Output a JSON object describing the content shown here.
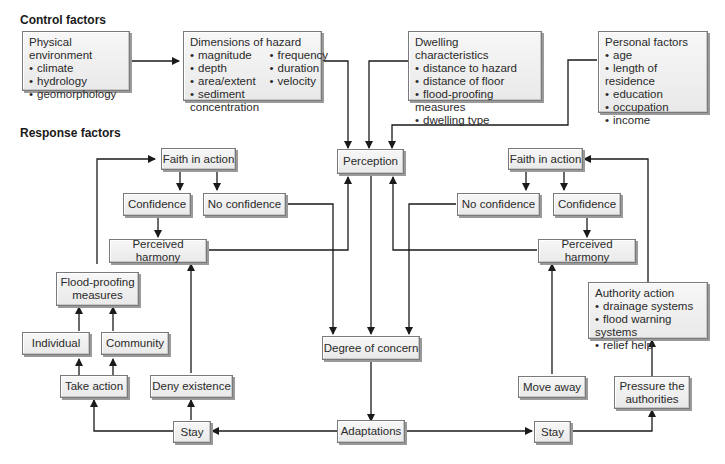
{
  "sections": {
    "control": "Control factors",
    "response": "Response factors"
  },
  "control_boxes": {
    "physical": {
      "title": "Physical environment",
      "items": [
        "climate",
        "hydrology",
        "geomorphology"
      ]
    },
    "hazard": {
      "title": "Dimensions of hazard",
      "items": [
        "magnitude",
        "frequency",
        "depth",
        "duration",
        "area/extent",
        "velocity"
      ],
      "wide_item": "sediment concentration"
    },
    "dwelling": {
      "title": "Dwelling characteristics",
      "items": [
        "distance to hazard",
        "distance of floor",
        "flood-proofing measures",
        "dwelling type"
      ]
    },
    "personal": {
      "title": "Personal factors",
      "items": [
        "age",
        "length of residence",
        "education",
        "occupation",
        "income"
      ]
    }
  },
  "nodes": {
    "perception": "Perception",
    "degree_of_concern": "Degree of concern",
    "adaptations": "Adaptations",
    "left": {
      "faith": "Faith in action",
      "confidence": "Confidence",
      "no_confidence": "No confidence",
      "harmony": "Perceived harmony",
      "floodproofing": "Flood-proofing measures",
      "individual": "Individual",
      "community": "Community",
      "take_action": "Take action",
      "deny": "Deny existence",
      "stay": "Stay"
    },
    "right": {
      "faith": "Faith in action",
      "no_confidence": "No confidence",
      "confidence": "Confidence",
      "harmony": "Perceived harmony",
      "authority": {
        "title": "Authority action",
        "items": [
          "drainage systems",
          "flood warning systems",
          "relief help"
        ]
      },
      "move_away": "Move away",
      "pressure": "Pressure the authorities",
      "stay": "Stay"
    }
  },
  "colors": {
    "line": "#1a1a1a",
    "box_fill": "#efefef",
    "box_border": "#7a7a7a"
  }
}
